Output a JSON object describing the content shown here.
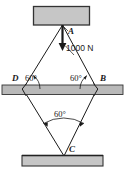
{
  "figure": {
    "colors": {
      "block_fill": "#c6c6c6",
      "block_edge": "#333333",
      "bar_fill": "#b9b9b9",
      "line": "#1a1a1a",
      "background": "#ffffff"
    },
    "labels": {
      "a": "A",
      "b": "B",
      "c": "C",
      "d": "D"
    },
    "angles": {
      "left": "60°",
      "right": "60°",
      "bottom": "60°"
    },
    "force": {
      "magnitude": "1000 N",
      "direction": "down"
    },
    "members": [
      {
        "name": "AD",
        "from": "A",
        "to": "D"
      },
      {
        "name": "AB",
        "from": "A",
        "to": "B"
      },
      {
        "name": "DC",
        "from": "D",
        "to": "C"
      },
      {
        "name": "BC",
        "from": "B",
        "to": "C"
      }
    ],
    "supports": {
      "top_block": "fixed ceiling block",
      "middle_bar": "horizontal support bar",
      "bottom_block": "fixed floor block"
    }
  }
}
